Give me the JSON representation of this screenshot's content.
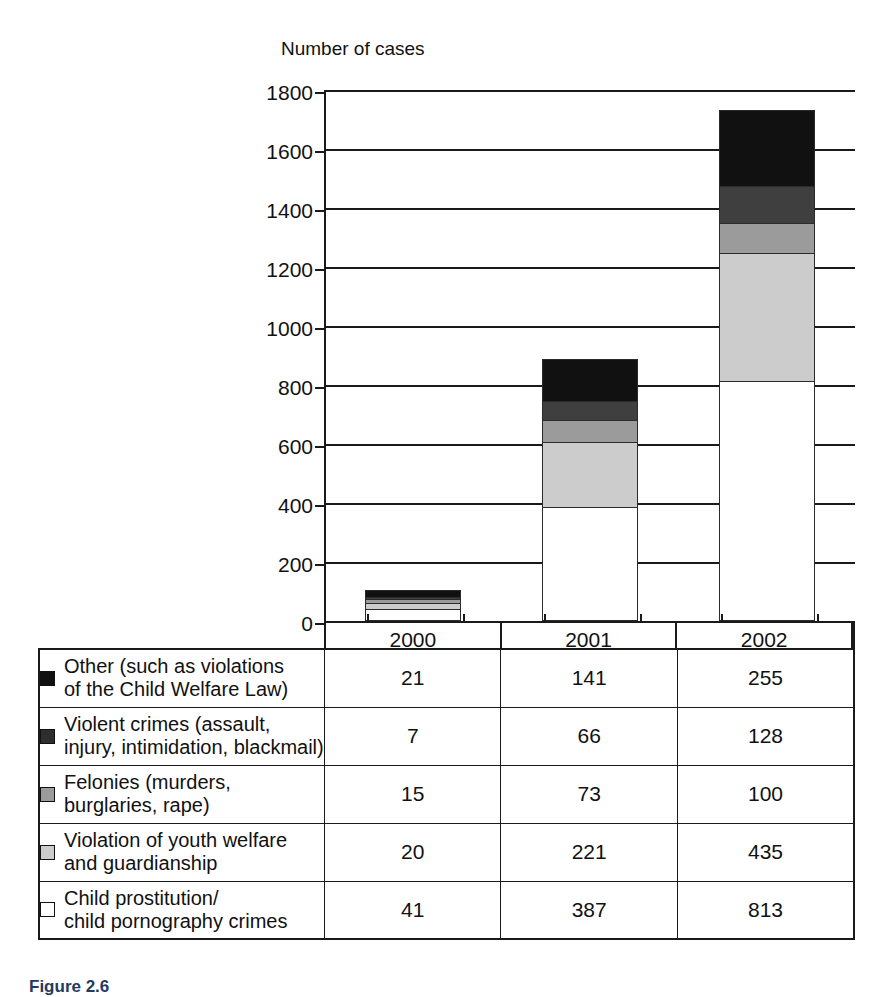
{
  "chart_data": {
    "type": "bar",
    "subtype": "stacked-vertical",
    "title": "",
    "ylabel": "Number of cases",
    "xlabel": "",
    "ylim": [
      0,
      1800
    ],
    "yticks": [
      0,
      200,
      400,
      600,
      800,
      1000,
      1200,
      1400,
      1600,
      1800
    ],
    "grid": true,
    "legend_position": "table-below",
    "categories": [
      "2000",
      "2001",
      "2002"
    ],
    "stack_order_bottom_to_top": [
      "Child prostitution/ child pornography crimes",
      "Violation of youth welfare and guardianship",
      "Felonies (murders, burglaries, rape)",
      "Violent crimes (assault, injury, intimidation, blackmail)",
      "Other (such as violations of the Child Welfare Law)"
    ],
    "series": [
      {
        "name": "Other (such as violations of the Child Welfare Law)",
        "color": "#111111",
        "values": [
          21,
          141,
          255
        ]
      },
      {
        "name": "Violent crimes (assault, injury, intimidation, blackmail)",
        "color": "#3f3f3f",
        "values": [
          7,
          66,
          128
        ]
      },
      {
        "name": "Felonies (murders, burglaries, rape)",
        "color": "#9b9b9b",
        "values": [
          15,
          73,
          100
        ]
      },
      {
        "name": "Violation of youth welfare and guardianship",
        "color": "#cccccc",
        "values": [
          20,
          221,
          435
        ]
      },
      {
        "name": "Child prostitution/ child pornography crimes",
        "color": "#ffffff",
        "values": [
          41,
          387,
          813
        ]
      }
    ],
    "totals": [
      104,
      888,
      1731
    ]
  },
  "axis": {
    "title": "Number of cases",
    "ticks": [
      "1800",
      "1600",
      "1400",
      "1200",
      "1000",
      "800",
      "600",
      "400",
      "200",
      "0"
    ]
  },
  "xcategories": [
    "2000",
    "2001",
    "2002"
  ],
  "legend_rows": [
    {
      "swatch": "#111111",
      "swatch_name": "legend-swatch-other",
      "line1": "Other (such as violations",
      "line2": "of the Child Welfare Law)",
      "values": [
        "21",
        "141",
        "255"
      ]
    },
    {
      "swatch": "#2e2e2e",
      "swatch_name": "legend-swatch-violent-crimes",
      "line1": "Violent crimes (assault,",
      "line2": "injury, intimidation, blackmail)",
      "values": [
        "7",
        "66",
        "128"
      ]
    },
    {
      "swatch": "#9b9b9b",
      "swatch_name": "legend-swatch-felonies",
      "line1": "Felonies (murders,",
      "line2": "burglaries, rape)",
      "values": [
        "15",
        "73",
        "100"
      ]
    },
    {
      "swatch": "#cccccc",
      "swatch_name": "legend-swatch-youth-welfare",
      "line1": "Violation of youth welfare",
      "line2": "and guardianship",
      "values": [
        "20",
        "221",
        "435"
      ]
    },
    {
      "swatch": "#ffffff",
      "swatch_name": "legend-swatch-child-prostitution",
      "line1": "Child prostitution/",
      "line2": "child pornography crimes",
      "values": [
        "41",
        "387",
        "813"
      ]
    }
  ],
  "caption": "Figure 2.6"
}
